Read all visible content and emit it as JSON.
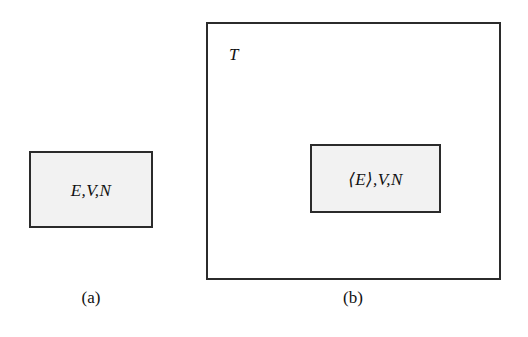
{
  "figure": {
    "background_color": "#ffffff",
    "line_color": "#2b2b2b",
    "box_fill_color": "#f2f2f2",
    "text_color": "#111111"
  },
  "panels": [
    {
      "id": "a",
      "caption": "(a)",
      "system_box": {
        "label": "E,V,N",
        "filled": true
      }
    },
    {
      "id": "b",
      "caption": "(b)",
      "reservoir_box": {
        "label": "T",
        "filled": false
      },
      "system_box": {
        "label": "⟨E⟩,V,N",
        "filled": true
      }
    }
  ]
}
